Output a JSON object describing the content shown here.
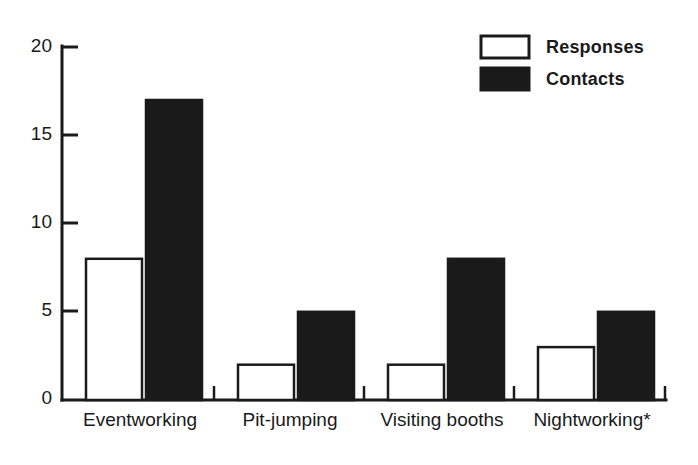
{
  "chart_data": {
    "type": "bar",
    "title": "",
    "subtitle": "",
    "xlabel": "",
    "ylabel": "",
    "categories": [
      "Eventworking",
      "Pit-jumping",
      "Visiting booths",
      "Nightworking*"
    ],
    "series": [
      {
        "name": "Responses",
        "values": [
          8,
          2,
          2,
          3
        ],
        "style": "open",
        "color": "#ffffff"
      },
      {
        "name": "Contacts",
        "values": [
          17,
          5,
          8,
          5
        ],
        "style": "filled",
        "color": "#1a1a1a"
      }
    ],
    "ylim": [
      0,
      20
    ],
    "ytick_labels": [
      "0",
      "5",
      "10",
      "15",
      "20"
    ],
    "ytick_values": [
      0,
      5,
      10,
      15,
      20
    ],
    "grid": false,
    "legend_position": "top-right",
    "axis_color": "#1a1a1a",
    "background_color": "#ffffff"
  },
  "legend": {
    "entries": [
      {
        "label": "Responses",
        "swatch": "open-square-swatch"
      },
      {
        "label": "Contacts",
        "swatch": "filled-square-swatch"
      }
    ]
  },
  "axes": {
    "y": {
      "ticks": [
        {
          "label": "20",
          "value": 20
        },
        {
          "label": "15",
          "value": 15
        },
        {
          "label": "10",
          "value": 10
        },
        {
          "label": "5",
          "value": 5
        },
        {
          "label": "0",
          "value": 0
        }
      ]
    },
    "x": {
      "ticks": [
        {
          "label": "Eventworking"
        },
        {
          "label": "Pit-jumping"
        },
        {
          "label": "Visiting booths"
        },
        {
          "label": "Nightworking*"
        }
      ]
    }
  }
}
